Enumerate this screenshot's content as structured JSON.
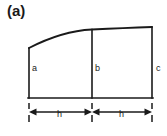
{
  "figure": {
    "panel_label": "(a)",
    "line_color": "#1a1a1a",
    "background_color": "#ffffff"
  },
  "ordinates": [
    {
      "id": "a",
      "label": "a",
      "x": 29,
      "top_y": 48,
      "base_y": 98
    },
    {
      "id": "b",
      "label": "b",
      "x": 92,
      "top_y": 30,
      "base_y": 98
    },
    {
      "id": "c",
      "label": "c",
      "x": 152,
      "top_y": 28,
      "base_y": 98
    }
  ],
  "baseline": {
    "y": 98,
    "x_start": 29,
    "x_end": 152
  },
  "curve": {
    "type": "concave-increasing",
    "start": {
      "x": 29,
      "y": 48
    },
    "mid": {
      "x": 92,
      "y": 30
    },
    "end": {
      "x": 152,
      "y": 26
    }
  },
  "dimensions": [
    {
      "id": "h-left",
      "label": "h",
      "x_start": 29,
      "x_end": 92,
      "y": 112
    },
    {
      "id": "h-right",
      "label": "h",
      "x_start": 92,
      "x_end": 152,
      "y": 112
    }
  ],
  "extension_ticks": [
    {
      "x": 29
    },
    {
      "x": 92
    },
    {
      "x": 152
    }
  ]
}
